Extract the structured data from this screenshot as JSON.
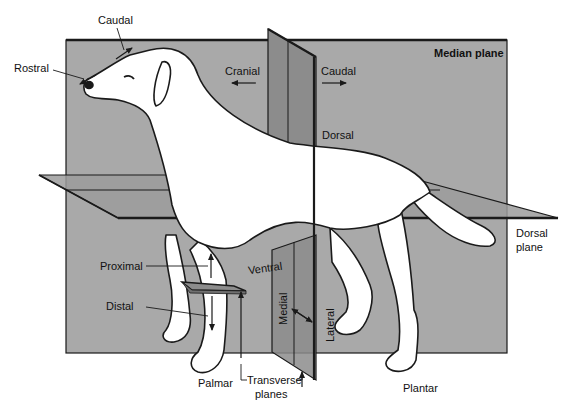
{
  "figure": {
    "colors": {
      "background": "#ffffff",
      "median_plane": "#a9a9a9",
      "transverse_plane": "#8c8c8c",
      "dorsal_plane": "#9c9c9c",
      "outline": "#1a1a1a",
      "dog_fill": "#ffffff"
    }
  },
  "labels": {
    "caudal_top": "Caudal",
    "rostral": "Rostral",
    "cranial": "Cranial",
    "caudal_right": "Caudal",
    "median_plane": "Median plane",
    "dorsal": "Dorsal",
    "dorsal_plane_line1": "Dorsal",
    "dorsal_plane_line2": "plane",
    "proximal": "Proximal",
    "ventral": "Ventral",
    "distal": "Distal",
    "medial": "Medial",
    "lateral": "Lateral",
    "palmar": "Palmar",
    "transverse_line1": "Transverse",
    "transverse_line2": "planes",
    "plantar": "Plantar"
  },
  "planes": [
    {
      "name": "Median plane",
      "orientation": "sagittal"
    },
    {
      "name": "Dorsal plane",
      "orientation": "horizontal"
    },
    {
      "name": "Transverse planes",
      "orientation": "vertical-cross"
    }
  ],
  "arrows": [
    {
      "label": "Rostral",
      "direction": "toward nose"
    },
    {
      "label": "Caudal",
      "direction": "toward tail (head region)"
    },
    {
      "label": "Cranial",
      "direction": "left"
    },
    {
      "label": "Caudal",
      "direction": "right"
    },
    {
      "label": "Proximal",
      "direction": "up"
    },
    {
      "label": "Distal",
      "direction": "down"
    },
    {
      "label": "Medial-Lateral",
      "direction": "double"
    }
  ]
}
